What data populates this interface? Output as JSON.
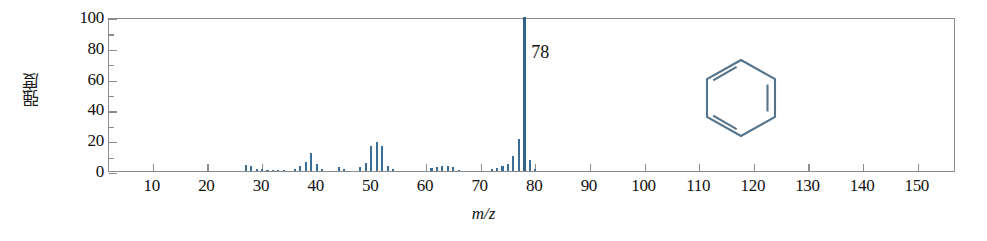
{
  "figure": {
    "title": "",
    "structure_name": "benzene-ring",
    "peak_annotation": "78",
    "accent_color": "#3d6e95",
    "axis_color": "#8c8c8c"
  },
  "chart_data": {
    "type": "bar",
    "title": "",
    "subtitle": "",
    "xlabel": "m/z",
    "ylabel": "强度",
    "xlim": [
      2,
      157
    ],
    "ylim": [
      0,
      100
    ],
    "grid": false,
    "legend": null,
    "annotations": [
      {
        "text": "78",
        "x": 78,
        "y": 100
      },
      {
        "text": "benzene-ring-structure",
        "x": 120,
        "y": 62
      }
    ],
    "x_ticks": [
      10,
      20,
      30,
      40,
      50,
      60,
      70,
      80,
      90,
      100,
      110,
      120,
      130,
      140,
      150
    ],
    "x_tick_labels": [
      "10",
      "20",
      "30",
      "40",
      "50",
      "60",
      "70",
      "80",
      "90",
      "100",
      "110",
      "120",
      "130",
      "140",
      "150"
    ],
    "y_ticks": [
      0,
      20,
      40,
      60,
      80,
      100
    ],
    "y_tick_labels": [
      "0",
      "20",
      "40",
      "60",
      "80",
      "100"
    ],
    "y_minor_ticks": [
      10,
      30,
      50,
      70,
      90
    ],
    "x": [
      27,
      28,
      29,
      30,
      31,
      32,
      33,
      34,
      36,
      37,
      38,
      39,
      40,
      41,
      44,
      45,
      48,
      49,
      50,
      51,
      52,
      53,
      54,
      61,
      62,
      63,
      64,
      65,
      66,
      72,
      73,
      74,
      75,
      76,
      77,
      78,
      79,
      80
    ],
    "values": [
      4,
      3.5,
      1.2,
      1,
      0.8,
      0.8,
      0.8,
      0.7,
      1.5,
      3.5,
      6,
      12,
      4.5,
      1.5,
      2.5,
      1,
      2.5,
      5,
      16,
      19,
      16,
      3.5,
      1.2,
      1.8,
      2.8,
      3.5,
      3.2,
      2.5,
      0.8,
      1.5,
      2,
      3,
      4.5,
      10,
      21,
      100,
      7,
      1.5
    ],
    "series": [
      {
        "name": "mass-spectrum",
        "values": [
          4,
          3.5,
          1.2,
          1,
          0.8,
          0.8,
          0.8,
          0.7,
          1.5,
          3.5,
          6,
          12,
          4.5,
          1.5,
          2.5,
          1,
          2.5,
          5,
          16,
          19,
          16,
          3.5,
          1.2,
          1.8,
          2.8,
          3.5,
          3.2,
          2.5,
          0.8,
          1.5,
          2,
          3,
          4.5,
          10,
          21,
          100,
          7,
          1.5
        ]
      }
    ]
  }
}
